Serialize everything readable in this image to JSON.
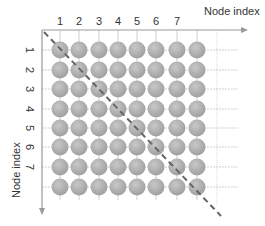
{
  "diagram": {
    "x_axis": {
      "label": "Node index",
      "ticks": [
        "1",
        "2",
        "3",
        "4",
        "5",
        "6",
        "7"
      ]
    },
    "y_axis": {
      "label": "Node index",
      "ticks": [
        "1",
        "2",
        "3",
        "4",
        "5",
        "6",
        "7"
      ]
    },
    "grid": {
      "rows": 8,
      "cols": 8
    },
    "colors": {
      "node": "#a9a9a9",
      "axis": "#999999",
      "grid": "#cccccc",
      "diagonal": "#666666"
    }
  }
}
